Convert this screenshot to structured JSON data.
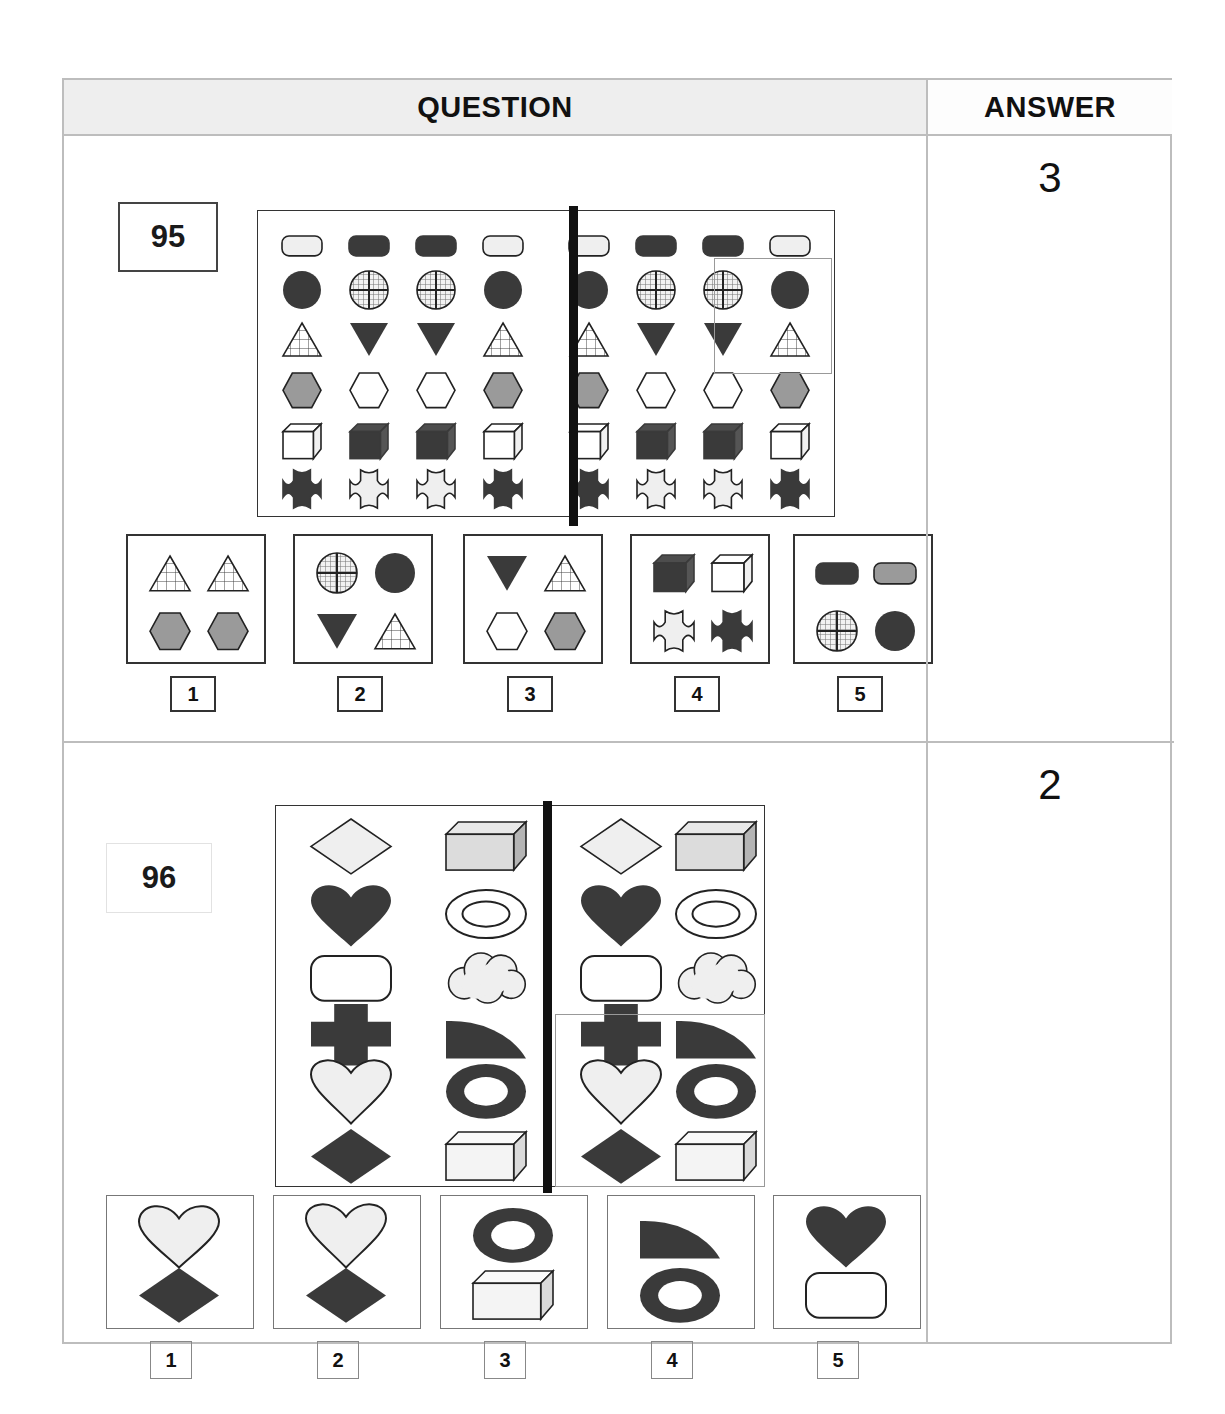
{
  "header": {
    "question_label": "QUESTION",
    "answer_label": "ANSWER"
  },
  "questions": [
    {
      "number": "95",
      "answer": "3",
      "matrix": {
        "rows": 6,
        "cols": 8,
        "split_after_col": 4,
        "highlight": {
          "rows": [
            3,
            4
          ],
          "cols": [
            7,
            8
          ]
        },
        "grid": [
          [
            "rect-light",
            "rect-dark",
            "rect-dark",
            "rect-light",
            "rect-light",
            "rect-dark",
            "rect-dark",
            "rect-light"
          ],
          [
            "circle-dark",
            "circle-crosshatch",
            "circle-crosshatch",
            "circle-dark",
            "circle-dark",
            "circle-crosshatch",
            "circle-crosshatch",
            "circle-dark"
          ],
          [
            "triangle-up-grid",
            "triangle-down-dark",
            "triangle-down-dark",
            "triangle-up-grid",
            "triangle-up-grid",
            "triangle-down-dark",
            "triangle-down-dark",
            "triangle-up-grid"
          ],
          [
            "hexagon-gray",
            "hexagon-white",
            "hexagon-white",
            "hexagon-gray",
            "hexagon-gray",
            "hexagon-white",
            "hexagon-white",
            "hexagon-gray"
          ],
          [
            "cube-white",
            "cube-dark",
            "cube-dark",
            "cube-white",
            "cube-white",
            "cube-dark",
            "cube-dark",
            "cube-white"
          ],
          [
            "cross-dark",
            "cross-light",
            "cross-light",
            "cross-dark",
            "cross-dark",
            "cross-light",
            "cross-light",
            "cross-dark"
          ]
        ]
      },
      "options": [
        {
          "label": "1",
          "shapes": [
            "triangle-up-grid",
            "triangle-up-grid",
            "hexagon-gray",
            "hexagon-gray"
          ]
        },
        {
          "label": "2",
          "shapes": [
            "circle-crosshatch",
            "circle-dark",
            "triangle-down-dark",
            "triangle-up-grid"
          ]
        },
        {
          "label": "3",
          "shapes": [
            "triangle-down-dark",
            "triangle-up-grid",
            "hexagon-white",
            "hexagon-gray"
          ]
        },
        {
          "label": "4",
          "shapes": [
            "cube-dark",
            "cube-white",
            "cross-light",
            "cross-dark"
          ]
        },
        {
          "label": "5",
          "shapes": [
            "rect-dark",
            "rect-gray",
            "circle-crosshatch",
            "circle-dark"
          ]
        }
      ]
    },
    {
      "number": "96",
      "answer": "2",
      "matrix": {
        "rows": 6,
        "cols": 4,
        "split_after_col": 2,
        "highlight": {
          "rows": [
            5,
            6
          ],
          "cols": [
            3,
            4
          ]
        },
        "grid": [
          [
            "diamond-light",
            "box3d-gray",
            "diamond-light",
            "box3d-gray"
          ],
          [
            "heart-dark-round",
            "ellipse-ring-outline",
            "heart-dark-round",
            "ellipse-ring-outline"
          ],
          [
            "roundrect-white",
            "cloud-light",
            "roundrect-white",
            "cloud-light"
          ],
          [
            "plus-dark",
            "quartercircle-dark",
            "plus-dark",
            "quartercircle-dark"
          ],
          [
            "heart-light-outline",
            "ring-dark",
            "heart-light-outline",
            "ring-dark"
          ],
          [
            "diamond-dark",
            "box3d-white",
            "diamond-dark",
            "box3d-white"
          ]
        ]
      },
      "options": [
        {
          "label": "1",
          "shapes": [
            "heart-round-outline",
            "diamond-dark"
          ]
        },
        {
          "label": "2",
          "shapes": [
            "heart-light-outline",
            "diamond-dark"
          ]
        },
        {
          "label": "3",
          "shapes": [
            "ring-dark",
            "box3d-white"
          ]
        },
        {
          "label": "4",
          "shapes": [
            "quartercircle-dark",
            "ring-dark"
          ]
        },
        {
          "label": "5",
          "shapes": [
            "heart-dark-round",
            "roundrect-white"
          ]
        }
      ]
    }
  ],
  "colors": {
    "dark": "#3a3a3a",
    "gray": "#9a9a9a",
    "light": "#efefef",
    "white": "#ffffff",
    "outline": "#222222",
    "frame": "#bdbdbd",
    "header_bg": "#eeeeee"
  }
}
